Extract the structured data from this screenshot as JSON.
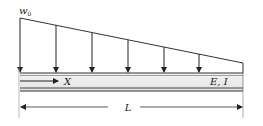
{
  "diagram": {
    "type": "beam-loading",
    "load": {
      "label": "w",
      "label_subscript": "0",
      "kind": "linearly decreasing distributed load",
      "arrow_count": 6
    },
    "beam": {
      "properties_label": "E, I",
      "coordinate_label": "X"
    },
    "dimension": {
      "label": "L"
    }
  }
}
